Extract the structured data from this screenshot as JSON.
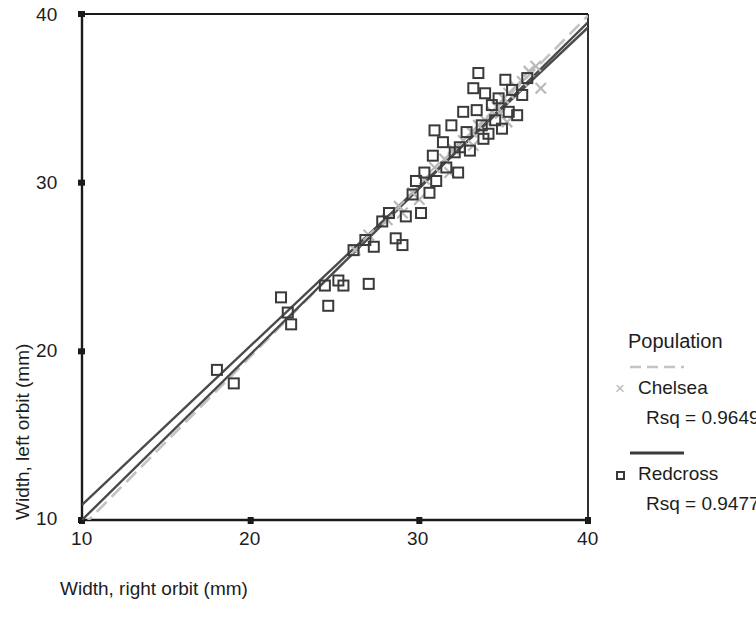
{
  "chart_data": {
    "type": "scatter",
    "title": "",
    "xlabel": "Width, right orbit (mm)",
    "ylabel": "Width, left orbit (mm)",
    "xlim": [
      10,
      40
    ],
    "ylim": [
      10,
      40
    ],
    "xticks": [
      10,
      20,
      30,
      40
    ],
    "yticks": [
      10,
      20,
      30,
      40
    ],
    "grid": false,
    "legend_position": "right",
    "legend_title": "Population",
    "series": [
      {
        "name": "Chelsea",
        "marker": "x",
        "color": "#b9b9b9",
        "line_style": "dashed",
        "rsq_label": "Rsq = 0.9649",
        "rsq": 0.9649,
        "fit_line": {
          "x0": 10,
          "y0": 9.6,
          "x1": 40,
          "y1": 39.9
        },
        "points": [
          [
            26.2,
            26.0
          ],
          [
            27.0,
            26.9
          ],
          [
            28.1,
            27.8
          ],
          [
            28.8,
            28.6
          ],
          [
            29.6,
            29.4
          ],
          [
            30.3,
            30.2
          ],
          [
            30.9,
            30.9
          ],
          [
            31.5,
            31.4
          ],
          [
            32.0,
            32.0
          ],
          [
            32.6,
            32.5
          ],
          [
            33.1,
            33.0
          ],
          [
            33.5,
            33.4
          ],
          [
            33.9,
            33.7
          ],
          [
            34.3,
            34.2
          ],
          [
            34.6,
            34.5
          ],
          [
            35.0,
            35.0
          ],
          [
            35.3,
            35.3
          ],
          [
            35.7,
            35.7
          ],
          [
            36.1,
            36.0
          ],
          [
            36.5,
            36.6
          ],
          [
            36.9,
            36.9
          ],
          [
            37.2,
            35.6
          ],
          [
            35.2,
            33.6
          ],
          [
            34.8,
            34.1
          ],
          [
            33.2,
            32.2
          ],
          [
            31.8,
            30.6
          ],
          [
            30.0,
            29.0
          ],
          [
            29.0,
            28.2
          ]
        ]
      },
      {
        "name": "Redcross",
        "marker": "square",
        "color": "#3a3a3a",
        "line_style": "solid",
        "rsq_label": "Rsq = 0.9477",
        "rsq": 0.9477,
        "fit_line": {
          "x0": 10,
          "y0": 10.9,
          "x1": 40,
          "y1": 39.2
        },
        "points": [
          [
            18.0,
            18.9
          ],
          [
            19.0,
            18.1
          ],
          [
            21.8,
            23.2
          ],
          [
            22.2,
            22.3
          ],
          [
            22.4,
            21.6
          ],
          [
            24.4,
            23.9
          ],
          [
            24.6,
            22.7
          ],
          [
            25.5,
            23.9
          ],
          [
            26.1,
            26.0
          ],
          [
            26.8,
            26.6
          ],
          [
            27.3,
            26.2
          ],
          [
            27.8,
            27.7
          ],
          [
            28.2,
            28.2
          ],
          [
            28.6,
            26.7
          ],
          [
            29.0,
            26.3
          ],
          [
            29.2,
            28.0
          ],
          [
            29.6,
            29.3
          ],
          [
            30.1,
            28.2
          ],
          [
            30.3,
            30.6
          ],
          [
            30.6,
            29.4
          ],
          [
            30.8,
            31.6
          ],
          [
            31.0,
            30.1
          ],
          [
            31.4,
            32.4
          ],
          [
            31.6,
            30.9
          ],
          [
            31.9,
            33.4
          ],
          [
            32.1,
            31.8
          ],
          [
            32.3,
            30.6
          ],
          [
            32.6,
            34.2
          ],
          [
            32.8,
            33.0
          ],
          [
            33.0,
            31.9
          ],
          [
            33.2,
            35.6
          ],
          [
            33.4,
            34.3
          ],
          [
            33.5,
            36.5
          ],
          [
            33.7,
            33.4
          ],
          [
            33.9,
            35.3
          ],
          [
            34.1,
            32.9
          ],
          [
            34.3,
            34.6
          ],
          [
            34.5,
            33.7
          ],
          [
            34.7,
            35.0
          ],
          [
            34.9,
            33.2
          ],
          [
            35.1,
            36.1
          ],
          [
            35.3,
            34.2
          ],
          [
            35.5,
            35.5
          ],
          [
            35.8,
            34.0
          ],
          [
            36.1,
            35.2
          ],
          [
            36.4,
            36.2
          ],
          [
            33.8,
            32.6
          ],
          [
            32.4,
            32.1
          ],
          [
            30.9,
            33.1
          ],
          [
            29.8,
            30.1
          ],
          [
            27.0,
            24.0
          ],
          [
            25.2,
            24.2
          ]
        ]
      }
    ],
    "reference_line": {
      "name": "overall-fit",
      "color": "#555555",
      "line_style": "solid",
      "x0": 10,
      "y0": 10.0,
      "x1": 40,
      "y1": 39.5
    }
  },
  "axes": {
    "x_tick_labels": [
      "10",
      "20",
      "30",
      "40"
    ],
    "y_tick_labels": [
      "10",
      "20",
      "30",
      "40"
    ],
    "x_axis_title": "Width, right orbit (mm)",
    "y_axis_title": "Width, left orbit (mm)"
  },
  "legend": {
    "title": "Population",
    "entries": [
      {
        "name": "Chelsea",
        "marker_glyph": "×",
        "rsq": "Rsq = 0.9649"
      },
      {
        "name": "Redcross",
        "marker_glyph": "□",
        "rsq": "Rsq = 0.9477"
      }
    ]
  },
  "colors": {
    "chelsea": "#b9b9b9",
    "redcross": "#3a3a3a",
    "axis": "#1a1a1a",
    "background": "#ffffff"
  }
}
